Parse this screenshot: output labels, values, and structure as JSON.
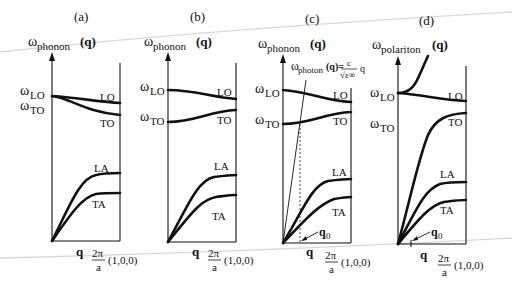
{
  "figure": {
    "panels": [
      {
        "label": "(a)",
        "y_axis": {
          "omega": "ω",
          "sub": "phonon",
          "arg": "(q)"
        },
        "left_labels": {
          "lo": {
            "omega": "ω",
            "sub": "LO"
          },
          "to": {
            "omega": "ω",
            "sub": "TO"
          }
        },
        "branches": {
          "lo": "LO",
          "to": "TO",
          "la": "LA",
          "ta": "TA"
        },
        "x_axis": {
          "q": "q",
          "frac_num": "2π",
          "frac_den": "a",
          "direction": "(1,0,0)"
        }
      },
      {
        "label": "(b)",
        "y_axis": {
          "omega": "ω",
          "sub": "phonon",
          "arg": "(q)"
        },
        "left_labels": {
          "lo": {
            "omega": "ω",
            "sub": "LO"
          },
          "to": {
            "omega": "ω",
            "sub": "TO"
          }
        },
        "branches": {
          "lo": "LO",
          "to": "TO",
          "la": "LA",
          "ta": "TA"
        },
        "x_axis": {
          "q": "q",
          "frac_num": "2π",
          "frac_den": "a",
          "direction": "(1,0,0)"
        }
      },
      {
        "label": "(c)",
        "y_axis": {
          "omega": "ω",
          "sub": "phonon",
          "arg": "(q)"
        },
        "left_labels": {
          "lo": {
            "omega": "ω",
            "sub": "LO"
          },
          "to": {
            "omega": "ω",
            "sub": "TO"
          }
        },
        "branches": {
          "lo": "LO",
          "to": "TO",
          "la": "LA",
          "ta": "TA"
        },
        "photon_line": {
          "omega": "ω",
          "sub": "photon",
          "arg": "(q)=",
          "num": "c",
          "den": "√ε∞",
          "tail": "q"
        },
        "q0": {
          "q": "q",
          "sub": "0"
        },
        "x_axis": {
          "q": "q",
          "frac_num": "2π",
          "frac_den": "a",
          "direction": "(1,0,0)"
        }
      },
      {
        "label": "(d)",
        "y_axis": {
          "omega": "ω",
          "sub": "polariton",
          "arg": "(q)"
        },
        "left_labels": {
          "lo": {
            "omega": "ω",
            "sub": "LO"
          },
          "to": {
            "omega": "ω",
            "sub": "TO"
          }
        },
        "branches": {
          "lo": "LO",
          "to": "TO",
          "la": "LA",
          "ta": "TA"
        },
        "q0": {
          "q": "q",
          "sub": "0"
        },
        "x_axis": {
          "q": "q",
          "frac_num": "2π",
          "frac_den": "a",
          "direction": "(1,0,0)"
        }
      }
    ]
  }
}
